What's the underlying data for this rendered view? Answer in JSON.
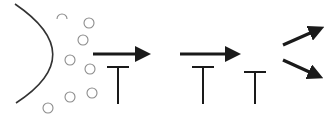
{
  "diagram": {
    "width": 333,
    "height": 118,
    "background": "#ffffff",
    "colors": {
      "stroke": "#1a1a1a",
      "bubble": "#8c8c8c",
      "curve": "#333333"
    },
    "curve": {
      "description": "parabolic surface / membrane",
      "path": "M15,4 Q90,55 16,103"
    },
    "bubbles": [
      {
        "cx": 62,
        "cy": 16,
        "r": 5,
        "open": true
      },
      {
        "cx": 89,
        "cy": 23,
        "r": 5
      },
      {
        "cx": 83,
        "cy": 40,
        "r": 5
      },
      {
        "cx": 70,
        "cy": 60,
        "r": 5
      },
      {
        "cx": 90,
        "cy": 69,
        "r": 5
      },
      {
        "cx": 70,
        "cy": 97,
        "r": 5
      },
      {
        "cx": 92,
        "cy": 93,
        "r": 5
      },
      {
        "cx": 48,
        "cy": 108,
        "r": 5
      }
    ],
    "arrows": [
      {
        "id": "arrow-1",
        "x1": 93,
        "y1": 54,
        "x2": 143,
        "y2": 54
      },
      {
        "id": "arrow-2",
        "x1": 180,
        "y1": 54,
        "x2": 233,
        "y2": 54
      },
      {
        "id": "arrow-up-right",
        "x1": 283,
        "y1": 45,
        "x2": 317,
        "y2": 30
      },
      {
        "id": "arrow-down-right",
        "x1": 283,
        "y1": 60,
        "x2": 316,
        "y2": 75
      }
    ],
    "t_shapes": [
      {
        "id": "t-1",
        "x": 118,
        "bar_top": 67,
        "half_width": 11,
        "bottom": 104
      },
      {
        "id": "t-2",
        "x": 203,
        "bar_top": 67,
        "half_width": 11,
        "bottom": 104
      },
      {
        "id": "t-3",
        "x": 255,
        "bar_top": 72,
        "half_width": 11,
        "bottom": 104
      }
    ]
  }
}
